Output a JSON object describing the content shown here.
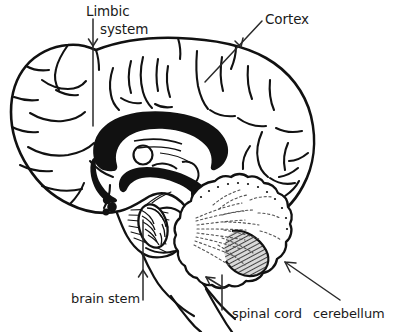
{
  "diagram": {
    "background_color": "#ffffff",
    "ink_color": "#111111",
    "hatch_color": "#8a8a8a",
    "labels": {
      "limbic_line1": "Limbic",
      "limbic_line2": "system",
      "cortex": "Cortex",
      "brain_stem": "brain stem",
      "spinal_cord": "spinal cord",
      "cerebellum": "cerebellum"
    },
    "structures": [
      {
        "name": "cerebral-cortex",
        "label": "Cortex"
      },
      {
        "name": "limbic-system",
        "label": "Limbic system"
      },
      {
        "name": "brain-stem",
        "label": "brain stem"
      },
      {
        "name": "spinal-cord",
        "label": "spinal cord"
      },
      {
        "name": "cerebellum",
        "label": "cerebellum"
      }
    ],
    "annotations": [
      {
        "name": "limbic-system-arrow",
        "direction": "down"
      },
      {
        "name": "cortex-arrow",
        "direction": "down-left"
      },
      {
        "name": "brain-stem-arrow",
        "direction": "up"
      },
      {
        "name": "spinal-cord-arrow",
        "direction": "up-left"
      },
      {
        "name": "cerebellum-arrow",
        "direction": "up-left"
      }
    ]
  }
}
